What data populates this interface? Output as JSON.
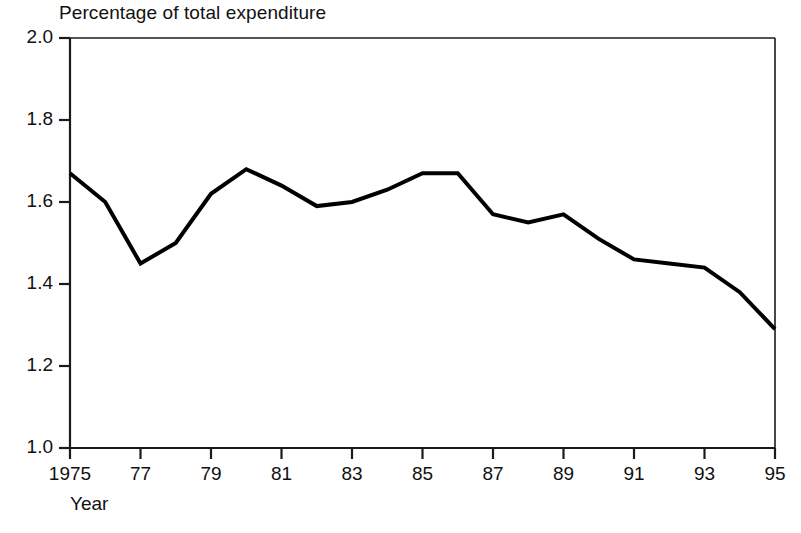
{
  "chart_data": {
    "type": "line",
    "title": "Percentage of total expenditure",
    "xlabel": "Year",
    "ylabel": "",
    "xlim": [
      1975,
      1995
    ],
    "ylim": [
      1.0,
      2.0
    ],
    "grid": false,
    "legend": null,
    "x_tick_labels": [
      "1975",
      "77",
      "79",
      "81",
      "83",
      "85",
      "87",
      "89",
      "91",
      "93",
      "95"
    ],
    "x_tick_values": [
      1975,
      1977,
      1979,
      1981,
      1983,
      1985,
      1987,
      1989,
      1991,
      1993,
      1995
    ],
    "y_tick_labels": [
      "2.0",
      "1.8",
      "1.6",
      "1.4",
      "1.2",
      "1.0"
    ],
    "y_tick_values": [
      2.0,
      1.8,
      1.6,
      1.4,
      1.2,
      1.0
    ],
    "x": [
      1975,
      1976,
      1977,
      1978,
      1979,
      1980,
      1981,
      1982,
      1983,
      1984,
      1985,
      1986,
      1987,
      1988,
      1989,
      1990,
      1991,
      1992,
      1993,
      1994,
      1995
    ],
    "values": [
      1.67,
      1.6,
      1.45,
      1.5,
      1.62,
      1.68,
      1.64,
      1.59,
      1.6,
      1.63,
      1.67,
      1.67,
      1.57,
      1.55,
      1.57,
      1.51,
      1.46,
      1.45,
      1.44,
      1.38,
      1.29
    ],
    "series": [
      {
        "name": "Percentage of total expenditure",
        "color": "#000000",
        "values": [
          1.67,
          1.6,
          1.45,
          1.5,
          1.62,
          1.68,
          1.64,
          1.59,
          1.6,
          1.63,
          1.67,
          1.67,
          1.57,
          1.55,
          1.57,
          1.51,
          1.46,
          1.45,
          1.44,
          1.38,
          1.29
        ]
      }
    ]
  },
  "style": {
    "line_color": "#000000",
    "axis_color": "#1a1a1a",
    "background": "#ffffff",
    "line_width": 4
  }
}
